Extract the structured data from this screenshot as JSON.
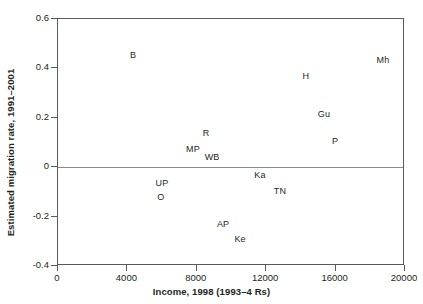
{
  "chart_data": {
    "type": "scatter",
    "title": "",
    "xlabel": "Income, 1998 (1993–4 Rs)",
    "ylabel": "Estimated migration rate, 1991–2001",
    "xlim": [
      0,
      20000
    ],
    "ylim": [
      -0.4,
      0.6
    ],
    "xticks": [
      0,
      4000,
      8000,
      12000,
      16000,
      20000
    ],
    "xtick_labels": [
      "0",
      "4000",
      "8000",
      "12000",
      "16000",
      "20000"
    ],
    "yticks": [
      -0.4,
      -0.2,
      0,
      0.2,
      0.4,
      0.6
    ],
    "ytick_labels": [
      "-0.4",
      "-0.2",
      "0",
      "0.2",
      "0.4",
      "0.6"
    ],
    "grid": false,
    "legend": "none",
    "marker_style": "text-label-only",
    "reference_lines": [
      {
        "name": "zero-line",
        "axis": "y",
        "value": 0,
        "color": "#8a8a8a"
      }
    ],
    "points": [
      {
        "label": "B",
        "x": 4320,
        "y": 0.455
      },
      {
        "label": "Mh",
        "x": 18730,
        "y": 0.432
      },
      {
        "label": "H",
        "x": 14290,
        "y": 0.368
      },
      {
        "label": "Gu",
        "x": 15330,
        "y": 0.215
      },
      {
        "label": "R",
        "x": 8530,
        "y": 0.139
      },
      {
        "label": "P",
        "x": 15970,
        "y": 0.106
      },
      {
        "label": "MP",
        "x": 7780,
        "y": 0.074
      },
      {
        "label": "WB",
        "x": 8880,
        "y": 0.042
      },
      {
        "label": "Ka",
        "x": 11640,
        "y": -0.033
      },
      {
        "label": "UP",
        "x": 5990,
        "y": -0.065
      },
      {
        "label": "TN",
        "x": 12790,
        "y": -0.097
      },
      {
        "label": "O",
        "x": 5930,
        "y": -0.122
      },
      {
        "label": "AP",
        "x": 9510,
        "y": -0.231
      },
      {
        "label": "Ke",
        "x": 10490,
        "y": -0.291
      }
    ]
  },
  "colors": {
    "frame": "#5a5a5a",
    "zero_line": "#8a8a8a",
    "text": "#231f20",
    "background": "#ffffff"
  }
}
